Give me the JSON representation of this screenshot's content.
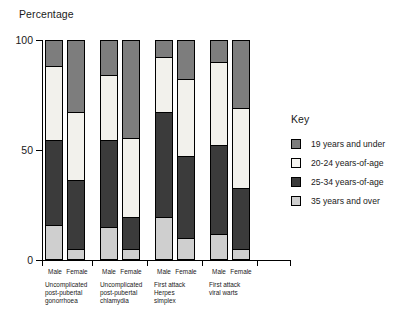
{
  "chart_data": {
    "type": "bar",
    "title": "",
    "ylabel": "Percentage",
    "xlabel": "",
    "ylim": [
      0,
      100
    ],
    "yticks": [
      0,
      50,
      100
    ],
    "ytick_labels": [
      "0",
      "50",
      "100"
    ],
    "grid": false,
    "stacked": true,
    "legend_title": "Key",
    "legend_position": "right",
    "series": [
      {
        "name": "19 years and under",
        "color": "#7d7d7d",
        "values": [
          12,
          33,
          16,
          45,
          8,
          18,
          10,
          31
        ]
      },
      {
        "name": "20-24 years-of-age",
        "color": "#f2f1ec",
        "values": [
          34,
          31,
          30,
          36,
          25,
          35,
          38,
          37
        ]
      },
      {
        "name": "25-34 years-of-age",
        "color": "#3b3b3b",
        "values": [
          39,
          32,
          40,
          15,
          48,
          38,
          41,
          28
        ]
      },
      {
        "name": "35 years and over",
        "color": "#cfcfcf",
        "values": [
          15,
          4,
          14,
          4,
          19,
          9,
          11,
          4
        ]
      }
    ],
    "categories": [
      "Uncomplicated post-pubertal gonorrhoea - Male",
      "Uncomplicated post-pubertal gonorrhoea - Female",
      "Uncomplicated post-pubertal chlamydia - Male",
      "Uncomplicated post-pubertal chlamydia - Female",
      "First attack Herpes simplex - Male",
      "First attack Herpes simplex - Female",
      "First attack viral warts - Male",
      "First attack viral warts - Female"
    ],
    "groups": [
      {
        "label": "Uncomplicated post-pubertal gonorrhoea",
        "bars": [
          "Male",
          "Female"
        ]
      },
      {
        "label": "Uncomplicated post-pubertal chlamydia",
        "bars": [
          "Male",
          "Female"
        ]
      },
      {
        "label": "First attack Herpes simplex",
        "bars": [
          "Male",
          "Female"
        ]
      },
      {
        "label": "First attack viral warts",
        "bars": [
          "Male",
          "Female"
        ]
      }
    ]
  },
  "axis": {
    "ylabel": "Percentage",
    "tick_100": "100",
    "tick_50": "50",
    "tick_0": "0"
  },
  "legend": {
    "title": "Key",
    "items": [
      {
        "label": "19 years and under"
      },
      {
        "label": "20-24 years-of-age"
      },
      {
        "label": "25-34 years-of-age"
      },
      {
        "label": "35 years and over"
      }
    ]
  },
  "groups": [
    {
      "label_line1": "Uncomplicated",
      "label_line2": "post-pubertal",
      "label_line3": "gonorrhoea",
      "male": "Male",
      "female": "Female"
    },
    {
      "label_line1": "Uncomplicated",
      "label_line2": "post-pubertal",
      "label_line3": "chlamydia",
      "male": "Male",
      "female": "Female"
    },
    {
      "label_line1": "First attack",
      "label_line2": "Herpes",
      "label_line3": "simplex",
      "male": "Male",
      "female": "Female"
    },
    {
      "label_line1": "First attack",
      "label_line2": "viral warts",
      "label_line3": "",
      "male": "Male",
      "female": "Female"
    }
  ]
}
